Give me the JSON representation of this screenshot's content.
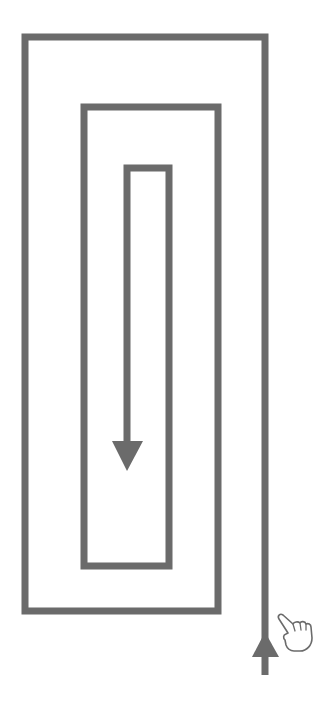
{
  "diagram": {
    "type": "rectangular-spiral-path",
    "colors": {
      "stroke": "#6b6b6b",
      "background": "#ffffff",
      "hand_outline": "#6b6b6b",
      "hand_fill": "#ffffff"
    },
    "stroke_width": 7,
    "spiral_points": "265,675 265,37 25,37 25,611 218,611 218,107 84,107 84,566 169,566 169,168 127,168 127,445",
    "arrows": {
      "start_up": {
        "points": "252,657 265,632 279,657",
        "direction": "up"
      },
      "end_down": {
        "points": "112,441 143,441 127,471",
        "direction": "down"
      }
    },
    "gesture_icon": {
      "name": "pointing-hand",
      "x": 276,
      "y": 613
    }
  }
}
